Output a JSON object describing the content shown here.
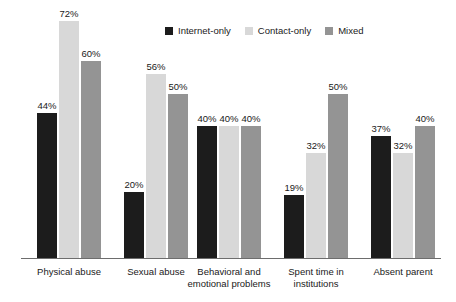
{
  "chart_data": {
    "type": "bar",
    "title": "",
    "subtitle": "",
    "xlabel": "",
    "ylabel": "",
    "ylim": [
      0,
      80
    ],
    "grid": false,
    "legend_position": "top-center",
    "value_suffix": "%",
    "categories": [
      "Physical abuse",
      "Sexual abuse",
      "Behavioral and\nemotional problems",
      "Spent time in\ninstitutions",
      "Absent parent"
    ],
    "series": [
      {
        "name": "Internet-only",
        "color": "#1c1c1c",
        "values": [
          44,
          20,
          40,
          19,
          37
        ]
      },
      {
        "name": "Contact-only",
        "color": "#d8d8d8",
        "values": [
          72,
          56,
          40,
          32,
          32
        ]
      },
      {
        "name": "Mixed",
        "color": "#949494",
        "values": [
          60,
          50,
          40,
          50,
          40
        ]
      }
    ],
    "data_labels": [
      [
        "44%",
        "72%",
        "60%"
      ],
      [
        "20%",
        "56%",
        "50%"
      ],
      [
        "40%",
        "40%",
        "40%"
      ],
      [
        "19%",
        "32%",
        "50%"
      ],
      [
        "37%",
        "32%",
        "40%"
      ]
    ]
  },
  "legend": {
    "items": [
      {
        "label": "Internet-only",
        "color": "#1c1c1c"
      },
      {
        "label": "Contact-only",
        "color": "#d8d8d8"
      },
      {
        "label": "Mixed",
        "color": "#949494"
      }
    ]
  },
  "axis": {
    "baseline_color": "#6d6d6d"
  }
}
